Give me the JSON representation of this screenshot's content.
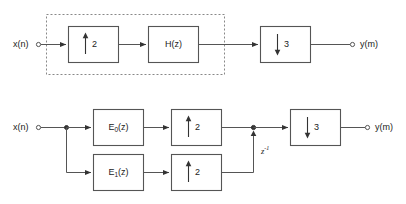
{
  "figure": {
    "background_color": "#ffffff",
    "line_color": "#555555",
    "dash_box_color": "#888888",
    "text_color": "#222222"
  },
  "top_diagram": {
    "input_label": "x(n)",
    "output_label": "y(m)",
    "dashed_group_present": true,
    "blocks": [
      {
        "id": "up2",
        "type": "upsampler",
        "glyph": "up-arrow",
        "factor": "2"
      },
      {
        "id": "hz",
        "type": "filter",
        "label": "H(z)"
      },
      {
        "id": "down3",
        "type": "downsampler",
        "glyph": "down-arrow",
        "factor": "3"
      }
    ]
  },
  "bottom_diagram": {
    "input_label": "x(n)",
    "output_label": "y(m)",
    "delay_label": "z",
    "delay_exponent": "-1",
    "branches": [
      {
        "id": "branch-0",
        "filter_label_base": "E",
        "filter_label_sub": "0",
        "filter_label_tail": "(z)",
        "upsampler_glyph": "up-arrow",
        "upsampler_factor": "2"
      },
      {
        "id": "branch-1",
        "filter_label_base": "E",
        "filter_label_sub": "1",
        "filter_label_tail": "(z)",
        "upsampler_glyph": "up-arrow",
        "upsampler_factor": "2"
      }
    ],
    "output_block": {
      "id": "down3b",
      "type": "downsampler",
      "glyph": "down-arrow",
      "factor": "3"
    }
  }
}
